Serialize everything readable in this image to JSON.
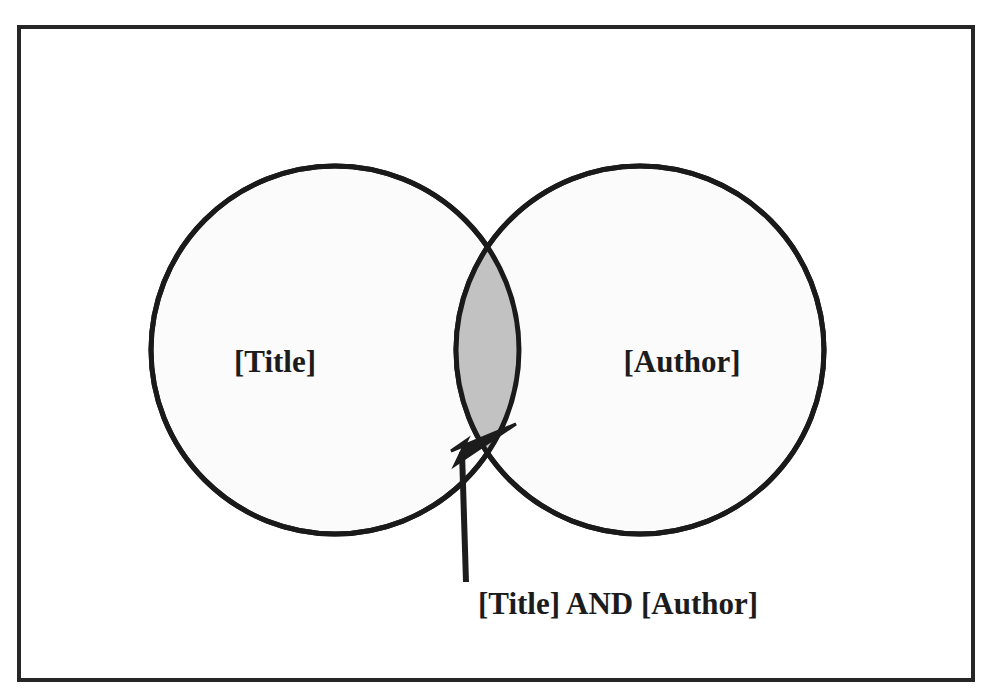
{
  "figure": {
    "type": "venn-diagram",
    "sets": [
      {
        "id": "left",
        "label": "[Title]"
      },
      {
        "id": "right",
        "label": "[Author]"
      }
    ],
    "intersection": {
      "label": "[Title] AND [Author]",
      "annotation_kind": "arrow-callout"
    },
    "colors": {
      "frame": "#262626",
      "circle_outline": "#1a1a1a",
      "circle_fill": "#fbfbfb",
      "intersection_fill": "#c2c2c2",
      "arrow": "#1c1c1c",
      "text": "#1c1c1c",
      "background": "#ffffff"
    }
  }
}
